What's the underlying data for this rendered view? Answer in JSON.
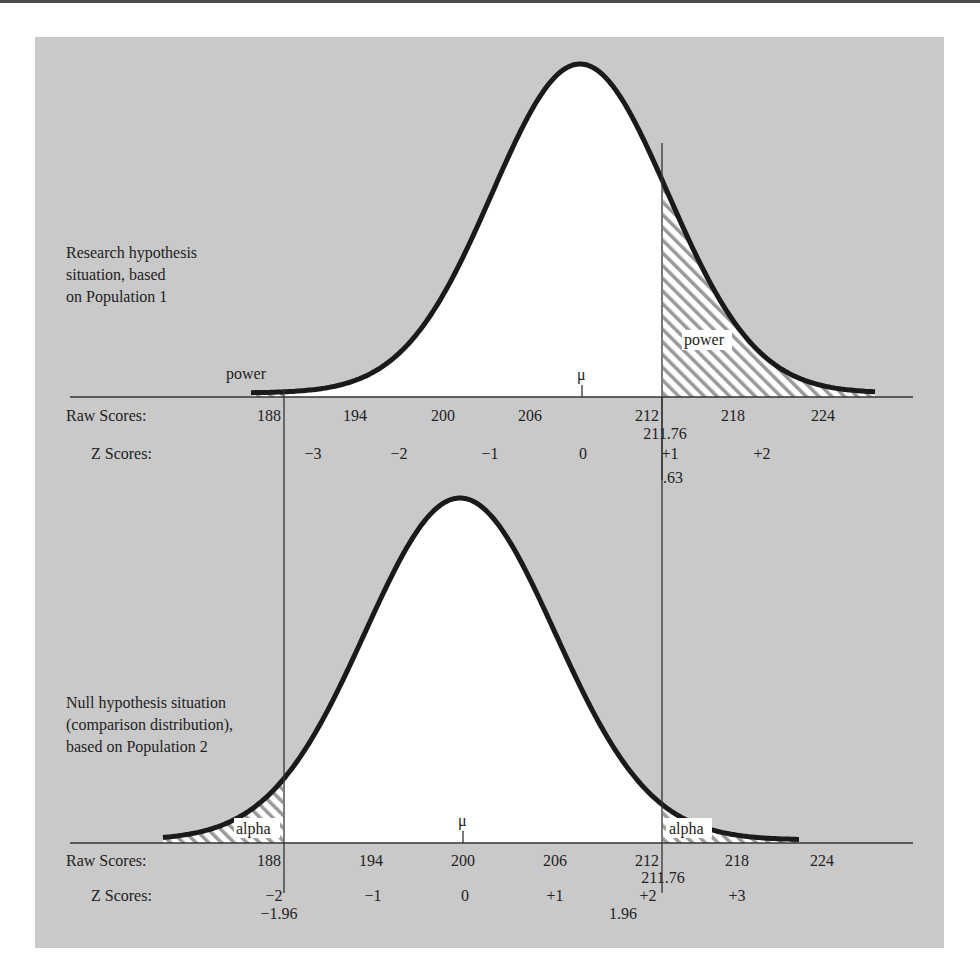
{
  "colors": {
    "panel_bg": "#c9c9c9",
    "curve_fill": "#ffffff",
    "curve_stroke": "#1a1a1a",
    "hatch": "#9a9a9a",
    "axis": "#333333"
  },
  "chart_data": {
    "type": "area",
    "title": "",
    "cutoff_raw": 211.76,
    "panels": [
      {
        "id": "research",
        "label_lines": [
          "Research hypothesis",
          "situation, based",
          "on Population 1"
        ],
        "mean": 208,
        "sd": 6,
        "mu_label": "μ",
        "raw_scores_label": "Raw Scores:",
        "raw_ticks": [
          "188",
          "194",
          "200",
          "206",
          "212",
          "218",
          "224"
        ],
        "z_scores_label": "Z Scores:",
        "z_ticks": [
          "−3",
          "−2",
          "−1",
          "0",
          "+1",
          "+2"
        ],
        "cutoff_raw_label": "211.76",
        "cutoff_z_label": ".63",
        "shaded_regions": [
          {
            "label": "power",
            "side": "right",
            "from": 211.76
          },
          {
            "label": "power",
            "side": "left",
            "to": 188
          }
        ]
      },
      {
        "id": "null",
        "label_lines": [
          "Null hypothesis situation",
          "(comparison distribution),",
          "based on Population 2"
        ],
        "mean": 200,
        "sd": 6,
        "mu_label": "μ",
        "raw_scores_label": "Raw Scores:",
        "raw_ticks": [
          "188",
          "194",
          "200",
          "206",
          "212",
          "218",
          "224"
        ],
        "z_scores_label": "Z Scores:",
        "z_ticks": [
          "−2",
          "−1",
          "0",
          "+1",
          "+2",
          "+3"
        ],
        "cutoff_raw_label": "211.76",
        "cutoff_z_labels": [
          "−1.96",
          "1.96"
        ],
        "shaded_regions": [
          {
            "label": "alpha",
            "side": "left",
            "to": 188.24
          },
          {
            "label": "alpha",
            "side": "right",
            "from": 211.76
          }
        ]
      }
    ]
  },
  "labels": {
    "research": {
      "line1": "Research hypothesis",
      "line2": "situation, based",
      "line3": "on Population 1",
      "power_left": "power",
      "power_right": "power",
      "mu": "μ",
      "raw_label": "Raw Scores:",
      "z_label": "Z Scores:",
      "raw": [
        "188",
        "194",
        "200",
        "206",
        "212",
        "218",
        "224"
      ],
      "cutoff_raw": "211.76",
      "z": [
        "−3",
        "−2",
        "−1",
        "0",
        "+1",
        "+2"
      ],
      "cutoff_z": ".63"
    },
    "null": {
      "line1": "Null hypothesis situation",
      "line2": "(comparison distribution),",
      "line3": "based on Population 2",
      "alpha_left": "alpha",
      "alpha_right": "alpha",
      "mu": "μ",
      "raw_label": "Raw Scores:",
      "z_label": "Z Scores:",
      "raw": [
        "188",
        "194",
        "200",
        "206",
        "212",
        "218",
        "224"
      ],
      "cutoff_raw": "211.76",
      "z": [
        "−2",
        "−1",
        "0",
        "+1",
        "+2",
        "+3"
      ],
      "cutoff_z_left": "−1.96",
      "cutoff_z_right": "1.96"
    }
  }
}
